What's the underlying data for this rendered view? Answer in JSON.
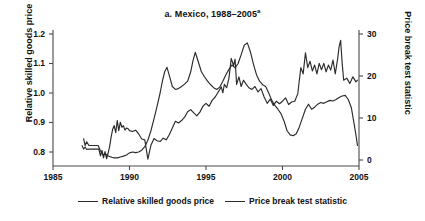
{
  "chart_data": {
    "type": "line",
    "title": "a. Mexico, 1988–2005",
    "title_superscript": "a",
    "xlabel": "",
    "ylabel": "Relative skilled goods price",
    "ylabel_right": "Price break test statistic",
    "xlim": [
      1985,
      2005
    ],
    "ylim": [
      0.8,
      1.2
    ],
    "ylim_right": [
      0,
      30
    ],
    "grid": false,
    "legend_position": "bottom",
    "xticks": [
      1985,
      1990,
      1995,
      2000,
      2005
    ],
    "xtick_labels": [
      "1985",
      "1990",
      "1995",
      "2000",
      "2005"
    ],
    "yticks_left": [
      0.8,
      0.9,
      1.0,
      1.1,
      1.2
    ],
    "ytick_labels_left": [
      "0.8",
      "0.9",
      "1.0",
      "1.1",
      "1.2"
    ],
    "yticks_right": [
      0,
      10,
      20,
      30
    ],
    "ytick_labels_right": [
      "0",
      "10",
      "20",
      "30"
    ],
    "line_color": "#2b2b2b",
    "series": [
      {
        "name": "Relative skilled goods price",
        "axis": "left",
        "x": [
          1987.0,
          1987.1,
          1987.2,
          1987.35,
          1987.5,
          1987.65,
          1987.8,
          1987.95,
          1988.1,
          1988.25,
          1988.4,
          1988.55,
          1988.7,
          1988.85,
          1989.0,
          1989.2,
          1989.4,
          1989.6,
          1989.8,
          1990.0,
          1990.2,
          1990.4,
          1990.6,
          1990.8,
          1991.0,
          1991.2,
          1991.4,
          1991.6,
          1991.8,
          1992.0,
          1992.15,
          1992.3,
          1992.45,
          1992.6,
          1992.8,
          1993.0,
          1993.2,
          1993.4,
          1993.6,
          1993.8,
          1994.0,
          1994.15,
          1994.3,
          1994.5,
          1994.7,
          1994.9,
          1995.1,
          1995.3,
          1995.5,
          1995.7,
          1995.9,
          1996.1,
          1996.3,
          1996.5,
          1996.7,
          1996.9,
          1997.1,
          1997.3,
          1997.5,
          1997.7,
          1997.9,
          1998.1,
          1998.3,
          1998.5,
          1998.7,
          1998.9,
          1999.1,
          1999.3,
          1999.5,
          1999.7,
          1999.9,
          2000.1,
          2000.3,
          2000.5,
          2000.7,
          2000.9,
          2001.1,
          2001.3,
          2001.5,
          2001.7,
          2001.9,
          2002.1,
          2002.3,
          2002.5,
          2002.7,
          2002.9,
          2003.1,
          2003.3,
          2003.5,
          2003.7,
          2003.9,
          2004.1,
          2004.3,
          2004.5,
          2004.65,
          2004.8,
          2004.9
        ],
        "y": [
          0.845,
          0.822,
          0.835,
          0.822,
          0.822,
          0.822,
          0.822,
          0.822,
          0.804,
          0.79,
          0.795,
          0.788,
          0.785,
          0.782,
          0.78,
          0.78,
          0.783,
          0.786,
          0.79,
          0.797,
          0.8,
          0.798,
          0.8,
          0.806,
          0.818,
          0.84,
          0.872,
          0.912,
          0.955,
          1.0,
          1.04,
          1.072,
          1.087,
          1.06,
          1.022,
          1.012,
          1.015,
          1.022,
          1.03,
          1.04,
          1.072,
          1.11,
          1.138,
          1.105,
          1.072,
          1.055,
          1.04,
          1.028,
          1.018,
          1.012,
          1.02,
          1.04,
          1.062,
          1.08,
          1.095,
          1.085,
          1.1,
          1.13,
          1.162,
          1.17,
          1.14,
          1.098,
          1.062,
          1.04,
          1.028,
          1.022,
          1.0,
          0.975,
          0.958,
          0.945,
          0.93,
          0.905,
          0.872,
          0.858,
          0.855,
          0.862,
          0.885,
          0.915,
          0.945,
          0.962,
          0.945,
          0.952,
          0.962,
          0.968,
          0.965,
          0.97,
          0.975,
          0.973,
          0.978,
          0.985,
          0.99,
          0.992,
          0.978,
          0.95,
          0.905,
          0.858,
          0.822
        ]
      },
      {
        "name": "Price break test statistic",
        "axis": "right",
        "x": [
          1986.9,
          1987.0,
          1987.1,
          1987.2,
          1987.3,
          1987.4,
          1987.5,
          1987.6,
          1987.7,
          1987.8,
          1987.9,
          1988.0,
          1988.1,
          1988.2,
          1988.3,
          1988.4,
          1988.5,
          1988.6,
          1988.7,
          1988.8,
          1988.9,
          1989.0,
          1989.1,
          1989.2,
          1989.3,
          1989.4,
          1989.5,
          1989.6,
          1989.7,
          1989.8,
          1989.9,
          1990.0,
          1990.2,
          1990.4,
          1990.6,
          1990.8,
          1991.0,
          1991.2,
          1991.4,
          1991.6,
          1991.8,
          1992.0,
          1992.2,
          1992.4,
          1992.6,
          1992.8,
          1993.0,
          1993.2,
          1993.4,
          1993.6,
          1993.8,
          1994.0,
          1994.2,
          1994.4,
          1994.6,
          1994.8,
          1995.0,
          1995.2,
          1995.4,
          1995.6,
          1995.8,
          1996.0,
          1996.1,
          1996.2,
          1996.35,
          1996.5,
          1996.65,
          1996.8,
          1996.9,
          1997.0,
          1997.15,
          1997.3,
          1997.45,
          1997.6,
          1997.8,
          1998.0,
          1998.2,
          1998.4,
          1998.6,
          1998.8,
          1999.0,
          1999.2,
          1999.4,
          1999.6,
          1999.8,
          2000.0,
          2000.2,
          2000.4,
          2000.6,
          2000.8,
          2001.0,
          2001.1,
          2001.2,
          2001.35,
          2001.5,
          2001.65,
          2001.8,
          2001.95,
          2002.1,
          2002.25,
          2002.4,
          2002.55,
          2002.7,
          2002.85,
          2003.0,
          2003.15,
          2003.3,
          2003.45,
          2003.6,
          2003.7,
          2003.8,
          2003.9,
          2004.0,
          2004.2,
          2004.4,
          2004.6,
          2004.8,
          2004.9
        ],
        "y": [
          3.4,
          2.6,
          3.1,
          2.5,
          2.6,
          2.6,
          2.6,
          2.6,
          2.6,
          2.6,
          2.6,
          2.6,
          1.0,
          2.3,
          0.5,
          2.0,
          0.3,
          1.6,
          3.2,
          5.5,
          7.3,
          8.2,
          6.5,
          9.4,
          7.0,
          9.0,
          7.8,
          8.2,
          7.1,
          7.6,
          7.5,
          7.0,
          6.8,
          7.1,
          6.2,
          5.0,
          4.8,
          0.2,
          3.5,
          5.1,
          4.6,
          4.4,
          5.2,
          4.8,
          6.0,
          7.6,
          9.2,
          8.8,
          9.4,
          10.2,
          11.5,
          12.0,
          11.2,
          10.5,
          11.4,
          12.8,
          13.5,
          12.8,
          14.2,
          15.0,
          16.2,
          17.4,
          16.0,
          18.0,
          17.2,
          19.5,
          24.2,
          22.5,
          24.0,
          18.0,
          19.8,
          17.5,
          19.0,
          18.2,
          17.2,
          16.8,
          17.5,
          16.2,
          17.0,
          15.0,
          13.5,
          14.5,
          13.0,
          14.0,
          13.4,
          14.0,
          14.8,
          13.2,
          13.8,
          14.0,
          15.8,
          19.0,
          22.0,
          20.5,
          25.5,
          22.0,
          23.5,
          21.2,
          22.6,
          20.5,
          23.0,
          21.5,
          23.0,
          21.0,
          22.6,
          21.4,
          23.8,
          20.5,
          24.0,
          27.0,
          28.5,
          23.0,
          19.0,
          19.5,
          18.2,
          19.8,
          18.6,
          19.0
        ]
      }
    ]
  },
  "title": {
    "text": "a. Mexico, 1988–2005",
    "superscript": "a"
  },
  "axes": {
    "left_label": "Relative skilled goods price",
    "right_label": "Price break test statistic",
    "xtick_labels": [
      "1985",
      "1990",
      "1995",
      "2000",
      "2005"
    ],
    "ytick_labels_left": [
      "1.2",
      "1.1",
      "1.0",
      "0.9",
      "0.8"
    ],
    "ytick_labels_right": [
      "30",
      "20",
      "10",
      "0"
    ]
  },
  "legend": {
    "items": [
      {
        "label": "Relative skilled goods price"
      },
      {
        "label": "Price break test statistic"
      }
    ]
  }
}
